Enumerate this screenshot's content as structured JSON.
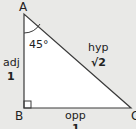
{
  "diagram": {
    "type": "right-triangle",
    "vertices": {
      "a": "A",
      "b": "B",
      "c": "C"
    },
    "angle_a": "45°",
    "right_angle_at": "B",
    "sides": {
      "adjacent": {
        "name": "adj",
        "value": "1"
      },
      "hypotenuse": {
        "name": "hyp",
        "value": "√2"
      },
      "opposite": {
        "name": "opp",
        "value": "1"
      }
    },
    "colors": {
      "background": "#e9e9e7",
      "fill": "#ffffff",
      "stroke": "#3a3a3a"
    }
  }
}
